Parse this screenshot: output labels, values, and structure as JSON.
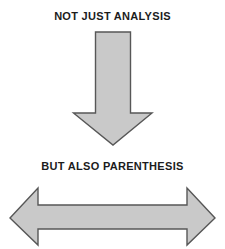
{
  "diagram": {
    "background_color": "#ffffff",
    "captions": {
      "top": "NOT JUST ANALYSIS",
      "middle": "BUT ALSO PARENTHESIS"
    },
    "shapes": {
      "down_arrow": {
        "name": "down-arrow",
        "direction": "down",
        "fill_color": "#c9c9c9",
        "outline_color": "#575757"
      },
      "double_arrow": {
        "name": "left-right-double-arrow",
        "direction": "left-right",
        "fill_color": "#c9c9c9",
        "outline_color": "#575757"
      }
    }
  }
}
